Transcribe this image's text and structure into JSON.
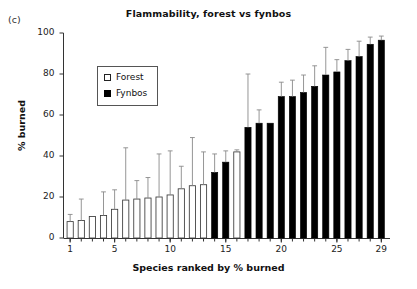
{
  "panel": {
    "label": "(c)"
  },
  "chart_data": {
    "type": "bar",
    "title": "Flammability, forest vs fynbos",
    "xlabel": "Species ranked by % burned",
    "ylabel": "% burned",
    "ylim": [
      0,
      100
    ],
    "yticks": [
      0,
      20,
      40,
      60,
      80,
      100
    ],
    "xlim": [
      0.4,
      29.6
    ],
    "xticks": [
      1,
      5,
      10,
      15,
      20,
      25,
      29
    ],
    "grid": false,
    "legend_position": "upper left inside",
    "errorbar_style": "upper whisker only (SD)",
    "colors": {
      "forest": "#ffffff",
      "fynbos": "#000000",
      "edge": "#222222",
      "whisker": "#888888"
    },
    "categories": [
      1,
      2,
      3,
      4,
      5,
      6,
      7,
      8,
      9,
      10,
      11,
      12,
      13,
      14,
      15,
      16,
      17,
      18,
      19,
      20,
      21,
      22,
      23,
      24,
      25,
      26,
      27,
      28,
      29
    ],
    "series": [
      {
        "name": "Forest",
        "key": "forest",
        "fill": "#ffffff",
        "values": [
          8,
          8.5,
          10.5,
          11,
          14,
          18.5,
          19,
          19.5,
          20,
          21,
          24,
          25.5,
          26,
          null,
          null,
          42,
          null,
          null,
          null,
          null,
          null,
          null,
          null,
          null,
          null,
          null,
          null,
          null,
          null
        ]
      },
      {
        "name": "Fynbos",
        "key": "fynbos",
        "fill": "#000000",
        "values": [
          null,
          null,
          null,
          null,
          null,
          null,
          null,
          null,
          null,
          null,
          null,
          null,
          null,
          32,
          37,
          null,
          54,
          56,
          56,
          69,
          69,
          71,
          74,
          79.5,
          81,
          86.5,
          88.5,
          94.5,
          96.5
        ]
      }
    ],
    "error_upper": [
      11.5,
      19,
      10.5,
      22.5,
      23.5,
      44,
      28,
      29.5,
      41,
      42.5,
      35,
      49,
      42,
      41,
      42.5,
      43,
      80,
      62.5,
      51.5,
      76,
      77,
      79.5,
      84,
      93,
      87,
      92,
      96,
      98,
      98.5
    ],
    "legend": [
      {
        "label": "Forest",
        "marker": "open-square"
      },
      {
        "label": "Fynbos",
        "marker": "filled-square"
      }
    ]
  }
}
